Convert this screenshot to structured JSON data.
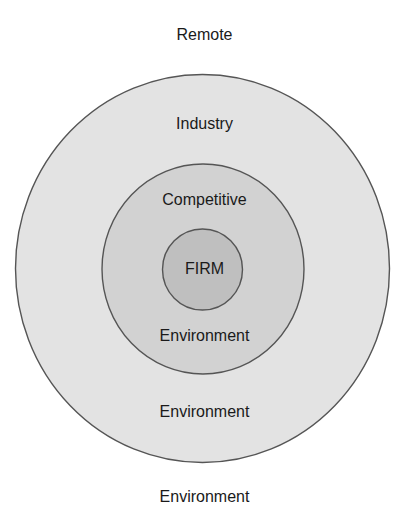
{
  "diagram": {
    "type": "concentric-circles",
    "outer_top_label": "Remote",
    "outer_bottom_label": "Environment",
    "rings": [
      {
        "id": "industry",
        "top_label": "Industry",
        "bottom_label": "Environment",
        "fill": "#e3e3e3",
        "stroke": "#555555",
        "cx": 202.5,
        "cy": 268.5,
        "rx": 187,
        "ry": 194
      },
      {
        "id": "competitive",
        "top_label": "Competitive",
        "bottom_label": "Environment",
        "fill": "#d2d2d2",
        "stroke": "#555555",
        "cx": 203,
        "cy": 269,
        "rx": 101,
        "ry": 105
      },
      {
        "id": "firm",
        "center_label": "FIRM",
        "fill": "#bfbfbf",
        "stroke": "#555555",
        "cx": 202.5,
        "cy": 269.5,
        "rx": 40,
        "ry": 40.5
      }
    ]
  }
}
